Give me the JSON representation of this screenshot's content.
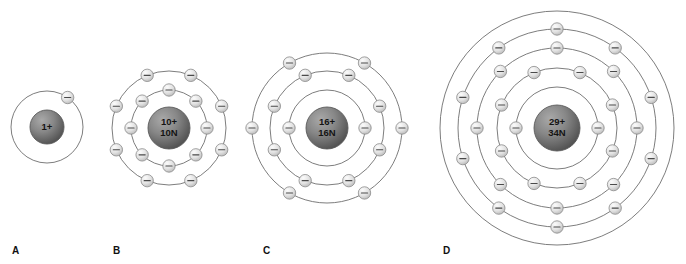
{
  "figure": {
    "background_color": "#ffffff",
    "width": 686,
    "height": 264
  },
  "style": {
    "shell_stroke": "#6e6e6e",
    "electron_fill_light": "#f2f2f2",
    "electron_fill_dark": "#b9b9b9",
    "electron_stroke": "#8a8a8a",
    "electron_sign": "minus-sign",
    "nucleus_fill_light": "#9c9c9c",
    "nucleus_fill_dark": "#4e4e4e",
    "nucleus_text_color": "#141414",
    "label_color": "#111111"
  },
  "atoms": [
    {
      "id": "A",
      "label": "A",
      "label_x": 12,
      "label_y": 246,
      "center_x": 47,
      "center_y": 127,
      "nucleus_radius": 17,
      "nucleus_lines": [
        "1+"
      ],
      "protons": "1+",
      "neutrons": "",
      "shells": [
        {
          "radius": 36,
          "electrons": 1,
          "start_angle": -55
        }
      ]
    },
    {
      "id": "B",
      "label": "B",
      "label_x": 113,
      "label_y": 246,
      "center_x": 169,
      "center_y": 128,
      "nucleus_radius": 21,
      "nucleus_lines": [
        "10+",
        "10N"
      ],
      "protons": "10+",
      "neutrons": "10N",
      "shells": [
        {
          "radius": 38,
          "electrons": 8,
          "start_angle": 0
        },
        {
          "radius": 57,
          "electrons": 8,
          "start_angle": 22.5
        }
      ]
    },
    {
      "id": "C",
      "label": "C",
      "label_x": 263,
      "label_y": 246,
      "center_x": 327,
      "center_y": 128,
      "nucleus_radius": 21,
      "nucleus_lines": [
        "16+",
        "16N"
      ],
      "protons": "16+",
      "neutrons": "16N",
      "shells": [
        {
          "radius": 38,
          "electrons": 2,
          "start_angle": 180
        },
        {
          "radius": 57,
          "electrons": 8,
          "start_angle": 22.5
        },
        {
          "radius": 75,
          "electrons": 6,
          "start_angle": 0
        }
      ]
    },
    {
      "id": "D",
      "label": "D",
      "label_x": 443,
      "label_y": 246,
      "center_x": 557,
      "center_y": 128,
      "nucleus_radius": 23,
      "nucleus_lines": [
        "29+",
        "34N"
      ],
      "protons": "29+",
      "neutrons": "34N",
      "shells": [
        {
          "radius": 41,
          "electrons": 2,
          "start_angle": 180
        },
        {
          "radius": 60,
          "electrons": 8,
          "start_angle": 22.5
        },
        {
          "radius": 80,
          "electrons": 8,
          "start_angle": 0
        },
        {
          "radius": 99,
          "electrons": 10,
          "start_angle": 18
        },
        {
          "radius": 117,
          "electrons": 0,
          "start_angle": 0
        }
      ]
    }
  ]
}
